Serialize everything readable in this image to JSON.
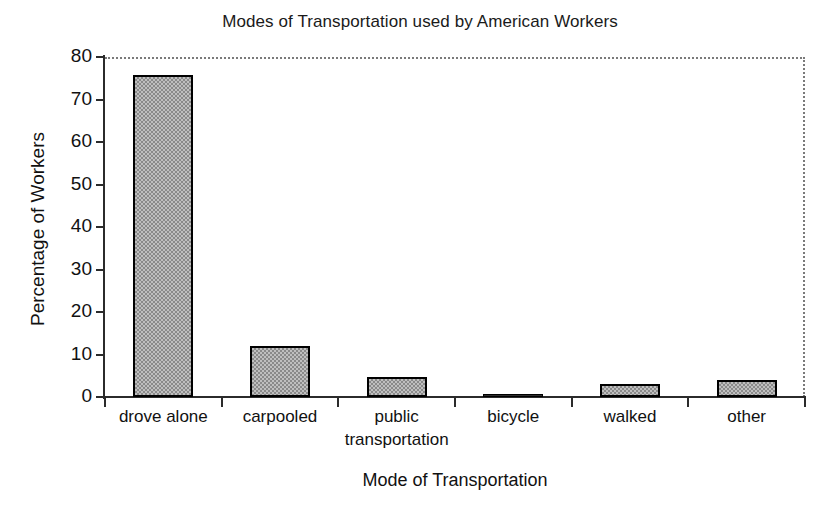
{
  "chart_data": {
    "type": "bar",
    "title": "Modes of Transportation used by American Workers",
    "xlabel": "Mode of Transportation",
    "ylabel": "Percentage of Workers",
    "categories": [
      "drove alone",
      "carpooled",
      "public transportation",
      "bicycle",
      "walked",
      "other"
    ],
    "values": [
      75.8,
      12.1,
      4.8,
      0.5,
      3.0,
      3.9
    ],
    "ylim": [
      0,
      80
    ],
    "yticks": [
      0,
      10,
      20,
      30,
      40,
      50,
      60,
      70,
      80
    ],
    "ytick_labels": [
      "0",
      "10",
      "20",
      "30",
      "40",
      "50",
      "60",
      "70",
      "80"
    ],
    "grid": false,
    "legend": "none",
    "bar_fill": "#bfbfbf",
    "bar_pattern": "checkerboard-dither",
    "bar_edge": "#000000",
    "plot_border_style": "dotted",
    "plot_border_color": "#7a7a7a",
    "axis_color": "#2b2b2b",
    "background": "#ffffff"
  },
  "labels": {
    "category_lines": [
      [
        "drove alone"
      ],
      [
        "carpooled"
      ],
      [
        "public",
        "transportation"
      ],
      [
        "bicycle"
      ],
      [
        "walked"
      ],
      [
        "other"
      ]
    ]
  }
}
